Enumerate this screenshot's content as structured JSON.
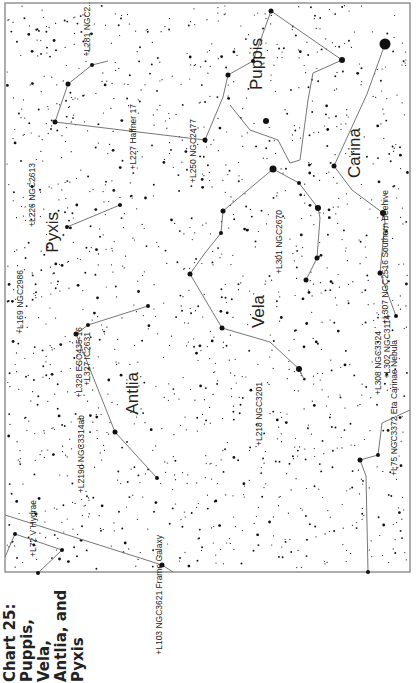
{
  "caption": {
    "lines": [
      "Chart 25:",
      "Puppis, Vela,",
      "Antlia, and",
      "Pyxis"
    ]
  },
  "chart_frame": {
    "x": 5,
    "y": 3,
    "width": 405,
    "height": 569,
    "border_color": "#777777"
  },
  "colors": {
    "star": "#111111",
    "line": "#777777",
    "text": "#222222",
    "background": "#ffffff"
  },
  "constellations": [
    {
      "name": "Puppis",
      "x": 262,
      "y": 38,
      "size": 17
    },
    {
      "name": "Carina",
      "x": 360,
      "y": 128,
      "size": 17
    },
    {
      "name": "Pyxis",
      "x": 58,
      "y": 212,
      "size": 17
    },
    {
      "name": "Vela",
      "x": 264,
      "y": 295,
      "size": 17
    },
    {
      "name": "Antlia",
      "x": 138,
      "y": 372,
      "size": 17
    }
  ],
  "objects": [
    {
      "label": "+L281 NGC2..",
      "x": 90,
      "y": 2
    },
    {
      "label": "+L227 Haffner 17",
      "x": 136,
      "y": 104
    },
    {
      "label": "+L250 NGC2477",
      "x": 196,
      "y": 119
    },
    {
      "label": "+L226 NGC2613",
      "x": 35,
      "y": 163
    },
    {
      "label": "+L307 NGC2516 Southern Beehive",
      "x": 388,
      "y": 190
    },
    {
      "label": "+L301 NGC2670",
      "x": 282,
      "y": 210
    },
    {
      "label": "+L169 NGC2986",
      "x": 23,
      "y": 270
    },
    {
      "label": "+L328 ESO435-16",
      "x": 82,
      "y": 327
    },
    {
      "label": "+L327 IC2631",
      "x": 90,
      "y": 332
    },
    {
      "label": "+L218 NGC3201",
      "x": 262,
      "y": 382
    },
    {
      "label": "+L308 NGC3324",
      "x": 381,
      "y": 331
    },
    {
      "label": "+L302 NGC3114",
      "x": 390,
      "y": 315
    },
    {
      "label": "+L75 NGC3372 Eta Carinae Nebula",
      "x": 397,
      "y": 340
    },
    {
      "label": "+L219d NGC3314ab",
      "x": 84,
      "y": 415
    },
    {
      "label": "+L72 V Hydrae",
      "x": 36,
      "y": 500
    },
    {
      "label": "+L103 NGC3621 Frame Galaxy",
      "x": 162,
      "y": 535
    }
  ],
  "lines": [
    [
      [
        55,
        122
      ],
      [
        68,
        84
      ],
      [
        92,
        65
      ],
      [
        108,
        61
      ]
    ],
    [
      [
        55,
        122
      ],
      [
        205,
        140
      ],
      [
        223,
        97
      ],
      [
        228,
        75
      ],
      [
        253,
        61
      ],
      [
        271,
        11
      ],
      [
        342,
        60
      ]
    ],
    [
      [
        342,
        60
      ],
      [
        313,
        73
      ],
      [
        308,
        100
      ],
      [
        300,
        160
      ],
      [
        290,
        163
      ],
      [
        278,
        140
      ],
      [
        250,
        130
      ],
      [
        230,
        105
      ]
    ],
    [
      [
        385,
        44
      ],
      [
        367,
        94
      ],
      [
        334,
        166
      ],
      [
        352,
        190
      ],
      [
        383,
        213
      ]
    ],
    [
      [
        273,
        169
      ],
      [
        299,
        183
      ],
      [
        318,
        208
      ],
      [
        320,
        218
      ],
      [
        317,
        258
      ],
      [
        306,
        280
      ]
    ],
    [
      [
        273,
        169
      ],
      [
        223,
        211
      ],
      [
        221,
        233
      ],
      [
        205,
        253
      ],
      [
        190,
        274
      ],
      [
        222,
        328
      ],
      [
        270,
        342
      ],
      [
        299,
        369
      ]
    ],
    [
      [
        299,
        369
      ],
      [
        304,
        379
      ]
    ],
    [
      [
        67,
        227
      ],
      [
        120,
        205
      ]
    ],
    [
      [
        383,
        213
      ],
      [
        385,
        222
      ],
      [
        380,
        273
      ],
      [
        396,
        316
      ]
    ],
    [
      [
        76,
        334
      ],
      [
        88,
        325
      ],
      [
        148,
        306
      ]
    ],
    [
      [
        76,
        334
      ],
      [
        115,
        432
      ],
      [
        157,
        478
      ]
    ],
    [
      [
        5,
        515
      ],
      [
        162,
        565
      ],
      [
        173,
        572
      ]
    ],
    [
      [
        15,
        534
      ],
      [
        62,
        550
      ]
    ],
    [
      [
        62,
        550
      ],
      [
        38,
        573
      ]
    ],
    [
      [
        15,
        534
      ],
      [
        5,
        557
      ]
    ],
    [
      [
        360,
        460
      ],
      [
        378,
        455
      ],
      [
        382,
        423
      ],
      [
        410,
        410
      ]
    ],
    [
      [
        360,
        460
      ],
      [
        366,
        476
      ],
      [
        368,
        572
      ]
    ]
  ],
  "bright_stars": [
    [
      385,
      44,
      5.5
    ],
    [
      342,
      60,
      3
    ],
    [
      271,
      11,
      2.5
    ],
    [
      253,
      61,
      2
    ],
    [
      228,
      75,
      2.5
    ],
    [
      205,
      140,
      2.5
    ],
    [
      55,
      122,
      2.5
    ],
    [
      68,
      84,
      2.5
    ],
    [
      92,
      65,
      2
    ],
    [
      273,
      169,
      3.5
    ],
    [
      299,
      183,
      2
    ],
    [
      318,
      208,
      3
    ],
    [
      317,
      258,
      2.5
    ],
    [
      306,
      280,
      2.5
    ],
    [
      223,
      211,
      2.5
    ],
    [
      221,
      233,
      2
    ],
    [
      190,
      274,
      2.5
    ],
    [
      222,
      328,
      2.5
    ],
    [
      299,
      369,
      3
    ],
    [
      334,
      166,
      2.5
    ],
    [
      383,
      213,
      3
    ],
    [
      380,
      273,
      2.5
    ],
    [
      396,
      316,
      2
    ],
    [
      67,
      227,
      2
    ],
    [
      120,
      205,
      2
    ],
    [
      88,
      325,
      2
    ],
    [
      76,
      334,
      2.5
    ],
    [
      148,
      306,
      2
    ],
    [
      115,
      432,
      2.5
    ],
    [
      157,
      478,
      2
    ],
    [
      162,
      565,
      2.5
    ],
    [
      15,
      534,
      2
    ],
    [
      62,
      550,
      2
    ],
    [
      38,
      573,
      2
    ],
    [
      360,
      460,
      2.5
    ],
    [
      378,
      455,
      2
    ],
    [
      368,
      572,
      2
    ],
    [
      266,
      121,
      3
    ]
  ],
  "star_field": {
    "count": 1500,
    "seed": 25
  }
}
